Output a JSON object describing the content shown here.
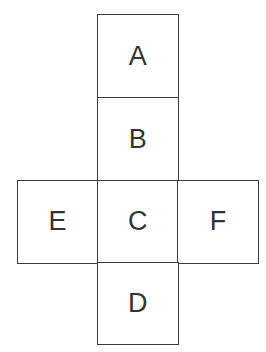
{
  "figure": {
    "type": "cube-net-diagram",
    "colors": {
      "background": "#ffffff",
      "line": "#3a3a3a",
      "text": "#333333"
    },
    "cells": {
      "a": {
        "label": "A",
        "position": "top of column"
      },
      "b": {
        "label": "B",
        "position": "second in column"
      },
      "e": {
        "label": "E",
        "position": "left of middle row"
      },
      "c": {
        "label": "C",
        "position": "center of middle row"
      },
      "f": {
        "label": "F",
        "position": "right of middle row"
      },
      "d": {
        "label": "D",
        "position": "bottom of column"
      }
    }
  }
}
